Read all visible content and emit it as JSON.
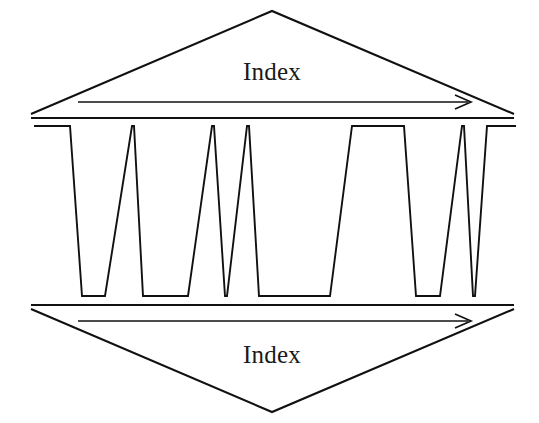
{
  "figure": {
    "background_color": "#ffffff",
    "line_color": "#111111",
    "width": 539,
    "height": 423
  },
  "top_index": {
    "label": "Index",
    "label_x": 272,
    "label_y": 80,
    "triangle_points": "31,114 272,11 514,114",
    "baseline_points": "31,118 514,118",
    "arrow_shaft": {
      "x1": 78,
      "y1": 102,
      "x2": 468,
      "y2": 102
    },
    "arrow_head": "455,95 471,102 455,109",
    "direction": "left-to-right"
  },
  "bottom_index": {
    "label": "Index",
    "label_x": 272,
    "label_y": 363,
    "triangle_points": "31,309 272,412 514,309",
    "baseline_points": "31,305 514,305",
    "arrow_shaft": {
      "x1": 78,
      "y1": 321,
      "x2": 468,
      "y2": 321
    },
    "arrow_head": "455,314 471,321 455,328",
    "direction": "left-to-right"
  },
  "waveform": {
    "high_level_y": 126,
    "low_level_y": 296,
    "start_x": 34,
    "end_x": 516,
    "description": "Square wave with varying pulse widths, some pulses degenerate to sharp spikes",
    "path": "M34,126 L70,126 L82,296 L105,296 L132,126 L134,126 L143,296 L178,296 L188,296 L212,126 L214,126 L225,296 L227,296 L247,126 L249,126 L259,296 L330,296 L352,126 L404,126 L416,296 L440,296 L462,126 L464,126 L473,296 L475,296 L487,126 L516,126",
    "segments": [
      {
        "type": "high",
        "x_start": 34,
        "x_end": 70
      },
      {
        "type": "fall",
        "x_start": 70,
        "x_end": 82
      },
      {
        "type": "low",
        "x_start": 82,
        "x_end": 105
      },
      {
        "type": "rise",
        "x_start": 105,
        "x_end": 132
      },
      {
        "type": "spike-peak",
        "x_start": 132,
        "x_end": 134
      },
      {
        "type": "fall",
        "x_start": 134,
        "x_end": 143
      },
      {
        "type": "low",
        "x_start": 143,
        "x_end": 188
      },
      {
        "type": "rise",
        "x_start": 188,
        "x_end": 212
      },
      {
        "type": "spike-peak",
        "x_start": 212,
        "x_end": 214
      },
      {
        "type": "fall",
        "x_start": 214,
        "x_end": 225
      },
      {
        "type": "spike-valley",
        "x_start": 225,
        "x_end": 227
      },
      {
        "type": "rise",
        "x_start": 227,
        "x_end": 247
      },
      {
        "type": "spike-peak",
        "x_start": 247,
        "x_end": 249
      },
      {
        "type": "fall",
        "x_start": 249,
        "x_end": 259
      },
      {
        "type": "low",
        "x_start": 259,
        "x_end": 330
      },
      {
        "type": "rise",
        "x_start": 330,
        "x_end": 352
      },
      {
        "type": "high",
        "x_start": 352,
        "x_end": 404
      },
      {
        "type": "fall",
        "x_start": 404,
        "x_end": 416
      },
      {
        "type": "low",
        "x_start": 416,
        "x_end": 440
      },
      {
        "type": "rise",
        "x_start": 440,
        "x_end": 462
      },
      {
        "type": "spike-peak",
        "x_start": 462,
        "x_end": 464
      },
      {
        "type": "fall",
        "x_start": 464,
        "x_end": 473
      },
      {
        "type": "spike-valley",
        "x_start": 473,
        "x_end": 475
      },
      {
        "type": "rise",
        "x_start": 475,
        "x_end": 487
      },
      {
        "type": "high",
        "x_start": 487,
        "x_end": 516
      }
    ]
  }
}
